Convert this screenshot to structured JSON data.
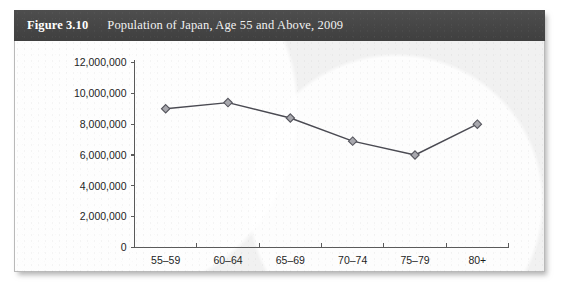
{
  "figure": {
    "number_label": "Figure 3.10",
    "title": "Population of Japan, Age 55 and Above, 2009"
  },
  "colors": {
    "title_bar_bg": "#474747",
    "title_text": "#ffffff",
    "panel_bg": "#f1f1f1",
    "panel_border": "#b9b9b9",
    "axis": "#5a5a5a",
    "series_line": "#4a4a52",
    "marker_fill": "#a8a8ae",
    "marker_stroke": "#55555d",
    "tick_text": "#1d1d1d"
  },
  "chart_data": {
    "type": "line",
    "title": "Population of Japan, Age 55 and Above, 2009",
    "xlabel": "",
    "ylabel": "",
    "categories": [
      "55–59",
      "60–64",
      "65–69",
      "70–74",
      "75–79",
      "80+"
    ],
    "values": [
      9000000,
      9400000,
      8400000,
      6900000,
      6000000,
      8000000
    ],
    "ylim": [
      0,
      12000000
    ],
    "ytick_values": [
      0,
      2000000,
      4000000,
      6000000,
      8000000,
      10000000,
      12000000
    ],
    "ytick_labels": [
      "0",
      "2,000,000",
      "4,000,000",
      "6,000,000",
      "8,000,000",
      "10,000,000",
      "12,000,000"
    ],
    "grid": false,
    "legend": false,
    "marker": "diamond",
    "series": [
      {
        "name": "Population",
        "values": [
          9000000,
          9400000,
          8400000,
          6900000,
          6000000,
          8000000
        ]
      }
    ]
  }
}
